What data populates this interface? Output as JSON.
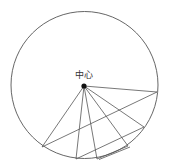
{
  "diagram": {
    "center_label": "中心",
    "colors": {
      "stroke": "#555555",
      "dot": "#111111",
      "text": "#333333"
    },
    "circle": {
      "cx": 84.5,
      "cy": 85,
      "r": 73.5
    },
    "center": {
      "x": 84,
      "y": 86
    },
    "points": [
      {
        "id": "A",
        "x": 157,
        "y": 92
      },
      {
        "id": "B",
        "x": 144,
        "y": 127
      },
      {
        "id": "C",
        "x": 128,
        "y": 146
      },
      {
        "id": "D",
        "x": 97,
        "y": 159
      },
      {
        "id": "E",
        "x": 76,
        "y": 159
      },
      {
        "id": "F",
        "x": 42,
        "y": 147
      }
    ],
    "radii": [
      "A",
      "B",
      "C",
      "D",
      "E",
      "F"
    ],
    "chords": [
      [
        "A",
        "F"
      ],
      [
        "B",
        "E"
      ],
      [
        "C",
        "D"
      ]
    ]
  }
}
